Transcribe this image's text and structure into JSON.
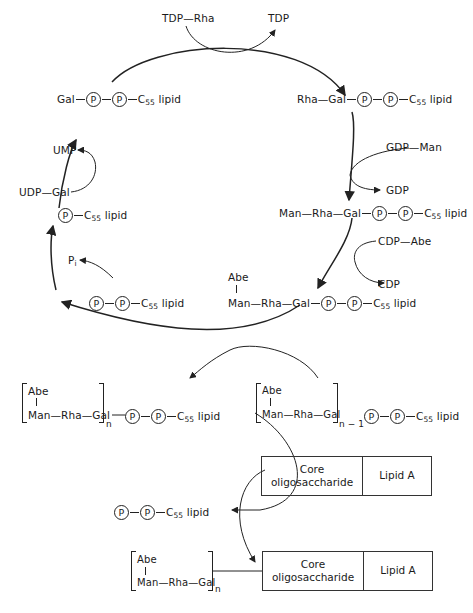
{
  "top": {
    "donor": "TDP—Rha",
    "product": "TDP"
  },
  "cycle": {
    "gal_lipid": {
      "prefix": "Gal",
      "p1": "P",
      "p2": "P",
      "tail": "C",
      "tail_sub": "55",
      "tail_suffix": " lipid"
    },
    "rha_gal_lipid": {
      "prefix": "Rha—Gal",
      "p1": "P",
      "p2": "P",
      "tail": "C",
      "tail_sub": "55",
      "tail_suffix": " lipid"
    },
    "gdp_man": "GDP—Man",
    "gdp": "GDP",
    "man_rha_gal_lipid": {
      "prefix": "Man—Rha—Gal",
      "p1": "P",
      "p2": "P",
      "tail": "C",
      "tail_sub": "55",
      "tail_suffix": " lipid"
    },
    "cdp_abe": "CDP—Abe",
    "cdp": "CDP",
    "abe_trisaccharide_lipid": {
      "branch": "Abe",
      "prefix": "Man—Rha—Gal",
      "p1": "P",
      "p2": "P",
      "tail": "C",
      "tail_sub": "55",
      "tail_suffix": " lipid"
    },
    "pp_lipid": {
      "p1": "P",
      "p2": "P",
      "tail": "C",
      "tail_sub": "55",
      "tail_suffix": " lipid"
    },
    "pi": "P",
    "pi_sub": "i",
    "p_lipid": {
      "p1": "P",
      "tail": "C",
      "tail_sub": "55",
      "tail_suffix": " lipid"
    },
    "udp_gal": "UDP—Gal",
    "ump": "UMP"
  },
  "polymer": {
    "left": {
      "branch": "Abe",
      "chain": "Man—Rha—Gal",
      "subscript": "n",
      "p1": "P",
      "p2": "P",
      "tail": "C",
      "tail_sub": "55",
      "tail_suffix": " lipid"
    },
    "right": {
      "branch": "Abe",
      "chain": "Man—Rha—Gal",
      "subscript": "n − 1",
      "p1": "P",
      "p2": "P",
      "tail": "C",
      "tail_sub": "55",
      "tail_suffix": " lipid"
    }
  },
  "transfer": {
    "acceptor_box": {
      "core": "Core\noligosaccharide",
      "lipid": "Lipid A"
    },
    "released": {
      "p1": "P",
      "p2": "P",
      "tail": "C",
      "tail_sub": "55",
      "tail_suffix": " lipid"
    },
    "product": {
      "branch": "Abe",
      "chain": "Man—Rha—Gal",
      "subscript": "n"
    },
    "product_box": {
      "core": "Core\noligosaccharide",
      "lipid": "Lipid A"
    }
  }
}
